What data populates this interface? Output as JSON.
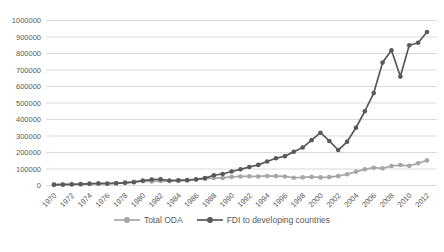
{
  "chart_data": {
    "type": "line",
    "title": "",
    "xlabel": "",
    "ylabel": "",
    "x": [
      1970,
      1971,
      1972,
      1973,
      1974,
      1975,
      1976,
      1977,
      1978,
      1979,
      1980,
      1981,
      1982,
      1983,
      1984,
      1985,
      1986,
      1987,
      1988,
      1989,
      1990,
      1991,
      1992,
      1993,
      1994,
      1995,
      1996,
      1997,
      1998,
      1999,
      2000,
      2001,
      2002,
      2003,
      2004,
      2005,
      2006,
      2007,
      2008,
      2009,
      2010,
      2011,
      2012
    ],
    "x_tick_labels": [
      "1970",
      "1972",
      "1974",
      "1976",
      "1978",
      "1980",
      "1982",
      "1984",
      "1986",
      "1988",
      "1990",
      "1992",
      "1994",
      "1996",
      "1998",
      "2000",
      "2002",
      "2004",
      "2006",
      "2008",
      "2010",
      "2012"
    ],
    "y_ticks": [
      0,
      100000,
      200000,
      300000,
      400000,
      500000,
      600000,
      700000,
      800000,
      900000,
      1000000
    ],
    "y_tick_labels": [
      "0",
      "100000",
      "200000",
      "300000",
      "400000",
      "500000",
      "600000",
      "700000",
      "800000",
      "900000",
      "1000000"
    ],
    "ylim": [
      0,
      1000000
    ],
    "grid": true,
    "legend_position": "bottom",
    "axis_text_color": "#595959",
    "gridline_color": "#d9d9d9",
    "series": [
      {
        "name": "Total ODA",
        "color": "#a6a6a6",
        "marker": "circle",
        "values": [
          7000,
          8000,
          9000,
          10000,
          12000,
          13000,
          14000,
          15000,
          18000,
          22000,
          26000,
          25000,
          27000,
          27000,
          28000,
          29000,
          35000,
          40000,
          46000,
          46000,
          52000,
          55000,
          56000,
          55000,
          58000,
          57000,
          55000,
          47000,
          49000,
          52000,
          49000,
          51000,
          57000,
          68000,
          84000,
          98000,
          108000,
          104000,
          118000,
          124000,
          119000,
          135000,
          152000
        ]
      },
      {
        "name": "FDI to developing countries",
        "color": "#595959",
        "marker": "circle",
        "values": [
          4000,
          5000,
          6000,
          8000,
          10000,
          12000,
          11000,
          13000,
          16000,
          20000,
          30000,
          36000,
          38000,
          30000,
          32000,
          33000,
          38000,
          45000,
          62000,
          70000,
          85000,
          98000,
          112000,
          125000,
          145000,
          165000,
          178000,
          205000,
          230000,
          275000,
          320000,
          270000,
          215000,
          265000,
          350000,
          450000,
          560000,
          745000,
          820000,
          660000,
          850000,
          865000,
          930000
        ]
      }
    ]
  }
}
